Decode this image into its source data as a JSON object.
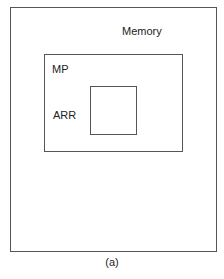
{
  "diagram": {
    "outer_box": {
      "label": "Memory"
    },
    "middle_box": {
      "label": "MP"
    },
    "inner_box": {
      "label": "ARR"
    },
    "caption": "(a)"
  }
}
